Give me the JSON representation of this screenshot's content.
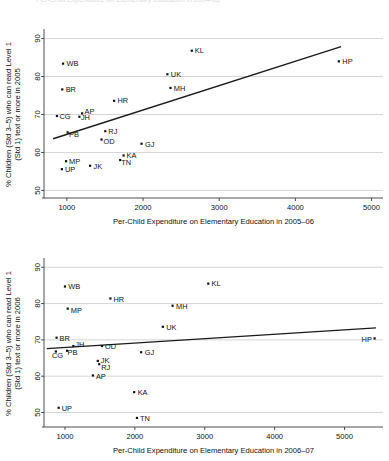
{
  "page": {
    "top_cut_text": "Per-Child Expenditure on Elementary Education in 2004-05"
  },
  "chart_data": [
    {
      "id": "chart-top",
      "type": "scatter",
      "title": "",
      "xlabel": "Per-Child Expenditure on Elementary Education in 2005–06",
      "ylabel_line1": "% Children (Std 3–5) who can read Level 1",
      "ylabel_line2": "(Std 1) text or more in 2005",
      "xlim": [
        700,
        5150
      ],
      "ylim": [
        48,
        92
      ],
      "xticks": [
        1000,
        2000,
        3000,
        4000,
        5000
      ],
      "yticks": [
        50,
        60,
        70,
        80,
        90
      ],
      "grid": true,
      "legend": "none",
      "point_label_field": "state",
      "points": [
        {
          "state": "WB",
          "x": 950,
          "y": 83.4
        },
        {
          "state": "KL",
          "x": 2640,
          "y": 86.8
        },
        {
          "state": "HP",
          "x": 4570,
          "y": 84.0
        },
        {
          "state": "UK",
          "x": 2320,
          "y": 80.6
        },
        {
          "state": "BR",
          "x": 940,
          "y": 76.6
        },
        {
          "state": "MH",
          "x": 2360,
          "y": 77.0
        },
        {
          "state": "HR",
          "x": 1620,
          "y": 73.6
        },
        {
          "state": "AP",
          "x": 1200,
          "y": 70.3
        },
        {
          "state": "CG",
          "x": 870,
          "y": 69.6
        },
        {
          "state": "JH",
          "x": 1165,
          "y": 69.4
        },
        {
          "state": "PB",
          "x": 1010,
          "y": 65.3
        },
        {
          "state": "RJ",
          "x": 1505,
          "y": 65.6
        },
        {
          "state": "OD",
          "x": 1455,
          "y": 63.4
        },
        {
          "state": "GJ",
          "x": 1980,
          "y": 62.3
        },
        {
          "state": "KA",
          "x": 1745,
          "y": 59.2
        },
        {
          "state": "TN",
          "x": 1700,
          "y": 58.0
        },
        {
          "state": "MP",
          "x": 990,
          "y": 57.7
        },
        {
          "state": "JK",
          "x": 1305,
          "y": 56.5
        },
        {
          "state": "UP",
          "x": 935,
          "y": 55.6
        }
      ],
      "fit_line": {
        "x1": 820,
        "y1": 63.6,
        "x2": 4600,
        "y2": 87.9
      }
    },
    {
      "id": "chart-bottom",
      "type": "scatter",
      "title": "",
      "xlabel": "Per-Child Expenditure on Elementary Education in 2006–07",
      "ylabel_line1": "% Children (Std 3–5) who can read Level 1",
      "ylabel_line2": "(Std 1) text or more in 2006",
      "xlim": [
        700,
        5550
      ],
      "ylim": [
        46,
        92
      ],
      "xticks": [
        1000,
        2000,
        3000,
        4000,
        5000
      ],
      "yticks": [
        50,
        60,
        70,
        80,
        90
      ],
      "grid": true,
      "legend": "none",
      "point_label_field": "state",
      "points": [
        {
          "state": "WB",
          "x": 1000,
          "y": 84.7
        },
        {
          "state": "KL",
          "x": 3050,
          "y": 85.5
        },
        {
          "state": "HR",
          "x": 1650,
          "y": 81.4
        },
        {
          "state": "MP",
          "x": 1040,
          "y": 78.6
        },
        {
          "state": "MH",
          "x": 2540,
          "y": 79.4
        },
        {
          "state": "UK",
          "x": 2400,
          "y": 73.6
        },
        {
          "state": "HP",
          "x": 5430,
          "y": 70.4
        },
        {
          "state": "BR",
          "x": 880,
          "y": 70.6
        },
        {
          "state": "JH",
          "x": 1120,
          "y": 68.3
        },
        {
          "state": "OD",
          "x": 1530,
          "y": 68.3
        },
        {
          "state": "PB",
          "x": 1030,
          "y": 67.0
        },
        {
          "state": "CG",
          "x": 870,
          "y": 66.8
        },
        {
          "state": "GJ",
          "x": 2090,
          "y": 66.6
        },
        {
          "state": "JK",
          "x": 1470,
          "y": 64.2
        },
        {
          "state": "RJ",
          "x": 1490,
          "y": 63.3
        },
        {
          "state": "AP",
          "x": 1400,
          "y": 60.2
        },
        {
          "state": "KA",
          "x": 1990,
          "y": 55.6
        },
        {
          "state": "UP",
          "x": 910,
          "y": 51.3
        },
        {
          "state": "TN",
          "x": 2030,
          "y": 48.5
        }
      ],
      "fit_line": {
        "x1": 740,
        "y1": 67.6,
        "x2": 5450,
        "y2": 73.3
      }
    }
  ]
}
